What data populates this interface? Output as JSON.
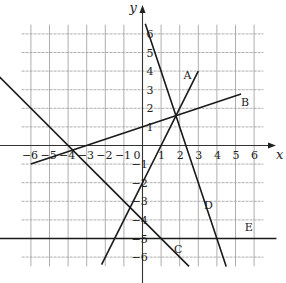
{
  "chart_data": {
    "type": "line",
    "title": "",
    "xlabel": "x",
    "ylabel": "y",
    "xlim": [
      -6.5,
      6.5
    ],
    "ylim": [
      -6.5,
      6.5
    ],
    "grid": true,
    "x_ticks": [
      "-6",
      "-5",
      "-4",
      "-3",
      "-2",
      "-1",
      "0",
      "1",
      "2",
      "3",
      "4",
      "5",
      "6"
    ],
    "y_ticks": [
      "6",
      "5",
      "4",
      "3",
      "2",
      "1",
      "-1",
      "-2",
      "-3",
      "-4",
      "-5",
      "-6"
    ],
    "series": [
      {
        "name": "A",
        "equation": "y = 2x - 2",
        "x": [
          -2.2,
          3
        ],
        "y": [
          -6.4,
          4
        ],
        "label_pos": [
          2.2,
          3.6
        ]
      },
      {
        "name": "B",
        "equation": "y = x/3 + 1",
        "x": [
          -6,
          5.3
        ],
        "y": [
          -1,
          2.77
        ],
        "label_pos": [
          5.3,
          2.1
        ]
      },
      {
        "name": "C",
        "equation": "y = -x - 4",
        "x": [
          -7.7,
          2.5
        ],
        "y": [
          3.7,
          -6.5
        ],
        "label_pos": [
          1.7,
          -5.8
        ]
      },
      {
        "name": "D",
        "equation": "y = -3x + 7",
        "x": [
          0.15,
          4.5
        ],
        "y": [
          6.55,
          -6.5
        ],
        "label_pos": [
          3.3,
          -3.4
        ]
      },
      {
        "name": "E",
        "equation": "y = -5",
        "x": [
          -7.7,
          7.2
        ],
        "y": [
          -5,
          -5
        ],
        "label_pos": [
          5.5,
          -4.6
        ]
      }
    ]
  }
}
